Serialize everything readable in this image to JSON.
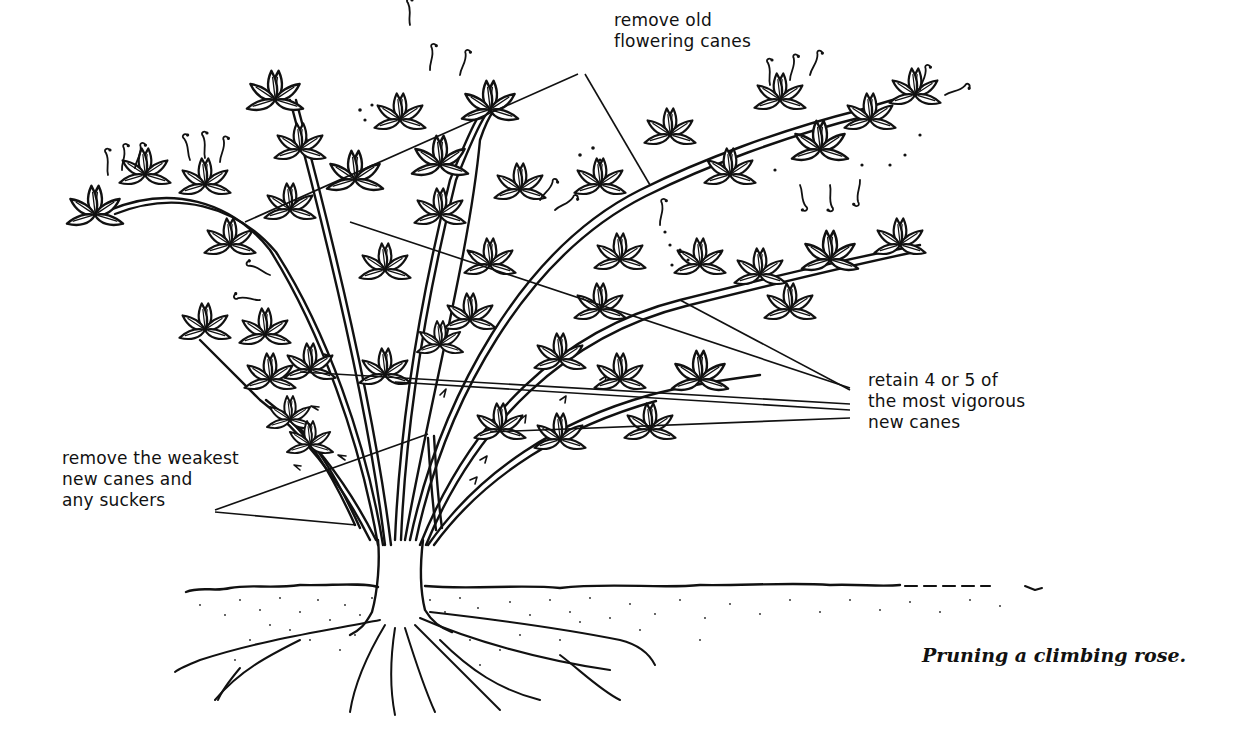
{
  "figure": {
    "caption": "Pruning a climbing rose.",
    "colors": {
      "ink": "#111111",
      "paper": "#ffffff"
    }
  },
  "labels": {
    "old_canes": {
      "lines": [
        "remove old",
        "flowering canes"
      ],
      "anchor": [
        578,
        74
      ],
      "targets": [
        [
          245,
          222
        ],
        [
          650,
          185
        ]
      ]
    },
    "vigorous_canes": {
      "lines": [
        "retain 4 or 5 of",
        "the most vigorous",
        "new canes"
      ],
      "anchor": [
        850,
        388
      ],
      "targets": [
        [
          350,
          222
        ],
        [
          680,
          300
        ],
        [
          300,
          372
        ],
        [
          395,
          382
        ],
        [
          490,
          432
        ]
      ]
    },
    "weak_canes": {
      "lines": [
        "remove the weakest",
        "new canes and",
        "any suckers"
      ],
      "anchor": [
        215,
        510
      ],
      "targets": [
        [
          428,
          434
        ],
        [
          356,
          525
        ]
      ]
    }
  }
}
